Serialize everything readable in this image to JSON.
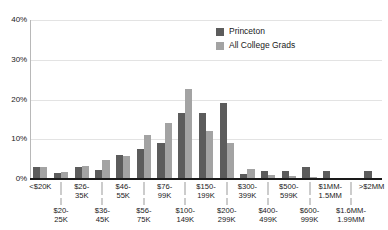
{
  "chart_data": {
    "type": "bar",
    "title": "",
    "xlabel": "",
    "ylabel": "",
    "ylim": [
      0,
      40
    ],
    "yticks": [
      0,
      10,
      20,
      30,
      40
    ],
    "ytick_labels": [
      "0%",
      "10%",
      "20%",
      "30%",
      "40%"
    ],
    "grid": true,
    "legend_position": "top-right",
    "categories": [
      "<$20K",
      "$20-25K",
      "$26-35K",
      "$36-45K",
      "$46-55K",
      "$56-75K",
      "$76-99K",
      "$100-149K",
      "$150-199K",
      "$200-299K",
      "$300-399K",
      "$400-499K",
      "$500-599K",
      "$600-999K",
      "$1MM-1.5MM",
      "$1.6MM-1.99MM",
      ">$2MM"
    ],
    "series": [
      {
        "name": "Princeton",
        "color": "#5c5c5c",
        "values": [
          2.9,
          1.4,
          2.9,
          2.2,
          6.0,
          7.6,
          9.1,
          16.7,
          16.7,
          19.1,
          1.2,
          2.1,
          2.1,
          2.9,
          2.1,
          0.2,
          2.0
        ]
      },
      {
        "name": "All College Grads",
        "color": "#a3a3a3",
        "values": [
          2.9,
          1.7,
          3.4,
          4.7,
          5.7,
          11.0,
          14.2,
          22.7,
          12.0,
          9.1,
          2.5,
          1.0,
          0.7,
          0.6,
          0.3,
          0.1,
          0.0
        ]
      }
    ]
  },
  "axis": {
    "y_tick_labels": [
      "40%",
      "30%",
      "20%",
      "10%",
      "0%"
    ]
  },
  "legend": {
    "items": [
      {
        "label": "Princeton",
        "color": "#5c5c5c"
      },
      {
        "label": "All College Grads",
        "color": "#a3a3a3"
      }
    ]
  },
  "x_axis": {
    "top_row": [
      "<$20K",
      "$26-",
      "35K",
      "$46-",
      "55K",
      "$76-",
      "99K",
      "$150-",
      "199K",
      "$300-",
      "399K",
      "$500-",
      "599K",
      "$1MM-",
      "1.5MM",
      ">$2MM"
    ],
    "bottom_row": [
      "$20-",
      "25K",
      "$36-",
      "45K",
      "$56-",
      "75K",
      "$100-",
      "149K",
      "$200-",
      "299K",
      "$400-",
      "499K",
      "$600-",
      "999K",
      "$1.6MM-",
      "1.99MM"
    ],
    "labels_top": [
      {
        "line1": "<$20K",
        "line2": ""
      },
      {
        "line1": "$26-",
        "line2": "35K"
      },
      {
        "line1": "$46-",
        "line2": "55K"
      },
      {
        "line1": "$76-",
        "line2": "99K"
      },
      {
        "line1": "$150-",
        "line2": "199K"
      },
      {
        "line1": "$300-",
        "line2": "399K"
      },
      {
        "line1": "$500-",
        "line2": "599K"
      },
      {
        "line1": "$1MM-",
        "line2": "1.5MM"
      },
      {
        "line1": ">$2MM",
        "line2": ""
      }
    ],
    "labels_bottom": [
      {
        "line1": "$20-",
        "line2": "25K"
      },
      {
        "line1": "$36-",
        "line2": "45K"
      },
      {
        "line1": "$56-",
        "line2": "75K"
      },
      {
        "line1": "$100-",
        "line2": "149K"
      },
      {
        "line1": "$200-",
        "line2": "299K"
      },
      {
        "line1": "$400-",
        "line2": "499K"
      },
      {
        "line1": "$600-",
        "line2": "999K"
      },
      {
        "line1": "$1.6MM-",
        "line2": "1.99MM"
      }
    ]
  },
  "colors": {
    "series_a": "#5c5c5c",
    "series_b": "#a3a3a3",
    "gridline": "#e3e3e3",
    "axis": "#1a1a1a",
    "background": "#ffffff"
  }
}
